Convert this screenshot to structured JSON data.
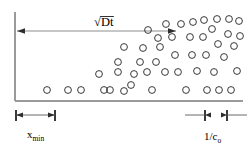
{
  "figure": {
    "background_color": "#ffffff",
    "width": 251,
    "height": 148
  },
  "labels": {
    "diffusion_length": {
      "name": "sqrt-Dt-label",
      "radical": "√",
      "text": "Dt",
      "full": "√Dt",
      "x": 108,
      "y": 17
    },
    "x_min": {
      "name": "x-min-label",
      "base": "x",
      "subscript": "min",
      "full": "x_min",
      "x": 27,
      "y": 138
    },
    "inv_c0": {
      "name": "one-over-c0-label",
      "base": "1/c",
      "subscript": "o",
      "full": "1/c₀",
      "x": 204,
      "y": 140
    }
  },
  "axes": {
    "vertical": {
      "name": "vertical-axis",
      "x": 15,
      "y1": 12,
      "y2": 101,
      "color": "#9a9a9a"
    },
    "horizontal": {
      "name": "horizontal-axis",
      "y": 101,
      "x1": 15,
      "x2": 243,
      "color": "#9a9a9a"
    }
  },
  "arrows": {
    "diffusion_span": {
      "name": "diffusion-length-arrow",
      "x1": 17,
      "x2": 176,
      "y": 31,
      "double_headed": true,
      "color": "#8d8d8d"
    }
  },
  "dimensions": [
    {
      "name": "x-min-dimension",
      "label_key": "x_min",
      "y": 115,
      "x1": 16,
      "x2": 55,
      "tick_height": 11,
      "arrow_style": "inward-double"
    },
    {
      "name": "inv-c0-dimension",
      "label_key": "inv_c0",
      "y": 115,
      "x1": 205,
      "x2": 227,
      "tick_height": 11,
      "arrow_style": "outward-double"
    }
  ],
  "chart_data": {
    "type": "scatter",
    "title": "√Dt",
    "xlabel": "",
    "ylabel": "",
    "marker": "open-circle",
    "marker_radius": 3.4,
    "xlim": [
      15,
      243
    ],
    "ylim": [
      101,
      12
    ],
    "grid": false,
    "legend": null,
    "annotations": [
      {
        "text": "√Dt",
        "x": 108,
        "y": 17
      },
      {
        "text": "x_min",
        "x": 27,
        "y": 138
      },
      {
        "text": "1/c₀",
        "x": 204,
        "y": 140
      }
    ],
    "points": [
      {
        "x": 47,
        "y": 90
      },
      {
        "x": 68,
        "y": 90
      },
      {
        "x": 81,
        "y": 90
      },
      {
        "x": 99,
        "y": 74
      },
      {
        "x": 110,
        "y": 90
      },
      {
        "x": 124,
        "y": 91
      },
      {
        "x": 118,
        "y": 62
      },
      {
        "x": 124,
        "y": 47
      },
      {
        "x": 131,
        "y": 85
      },
      {
        "x": 118,
        "y": 72
      },
      {
        "x": 143,
        "y": 48
      },
      {
        "x": 140,
        "y": 62
      },
      {
        "x": 147,
        "y": 72
      },
      {
        "x": 152,
        "y": 90
      },
      {
        "x": 156,
        "y": 62
      },
      {
        "x": 160,
        "y": 47
      },
      {
        "x": 165,
        "y": 72
      },
      {
        "x": 158,
        "y": 38
      },
      {
        "x": 172,
        "y": 37
      },
      {
        "x": 175,
        "y": 55
      },
      {
        "x": 178,
        "y": 72
      },
      {
        "x": 181,
        "y": 24
      },
      {
        "x": 186,
        "y": 90
      },
      {
        "x": 190,
        "y": 37
      },
      {
        "x": 193,
        "y": 22
      },
      {
        "x": 192,
        "y": 55
      },
      {
        "x": 197,
        "y": 71
      },
      {
        "x": 204,
        "y": 20
      },
      {
        "x": 203,
        "y": 37
      },
      {
        "x": 206,
        "y": 55
      },
      {
        "x": 207,
        "y": 90
      },
      {
        "x": 212,
        "y": 29
      },
      {
        "x": 214,
        "y": 72
      },
      {
        "x": 217,
        "y": 19
      },
      {
        "x": 218,
        "y": 44
      },
      {
        "x": 219,
        "y": 90
      },
      {
        "x": 224,
        "y": 57
      },
      {
        "x": 229,
        "y": 19
      },
      {
        "x": 228,
        "y": 34
      },
      {
        "x": 231,
        "y": 90
      },
      {
        "x": 234,
        "y": 46
      },
      {
        "x": 237,
        "y": 71
      },
      {
        "x": 239,
        "y": 21
      },
      {
        "x": 240,
        "y": 36
      },
      {
        "x": 148,
        "y": 30
      },
      {
        "x": 166,
        "y": 24
      },
      {
        "x": 134,
        "y": 74
      },
      {
        "x": 104,
        "y": 90
      }
    ]
  }
}
